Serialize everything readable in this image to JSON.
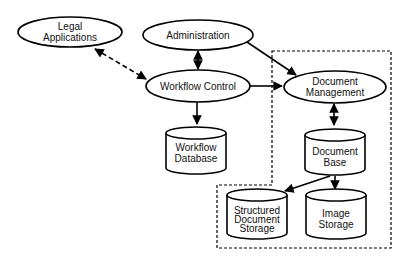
{
  "diagram": {
    "type": "system-architecture",
    "nodes": [
      {
        "id": "legal",
        "shape": "ellipse",
        "lines": [
          "Legal",
          "Applications"
        ]
      },
      {
        "id": "admin",
        "shape": "ellipse",
        "lines": [
          "Administration"
        ]
      },
      {
        "id": "workflow_control",
        "shape": "ellipse",
        "lines": [
          "Workflow Control"
        ]
      },
      {
        "id": "doc_mgmt",
        "shape": "ellipse",
        "lines": [
          "Document",
          "Management"
        ]
      },
      {
        "id": "workflow_db",
        "shape": "cylinder",
        "lines": [
          "Workflow",
          "Database"
        ]
      },
      {
        "id": "doc_base",
        "shape": "cylinder",
        "lines": [
          "Document",
          "Base"
        ]
      },
      {
        "id": "structured_storage",
        "shape": "cylinder",
        "lines": [
          "Structured",
          "Document",
          "Storage"
        ]
      },
      {
        "id": "image_storage",
        "shape": "cylinder",
        "lines": [
          "Image",
          "Storage"
        ]
      }
    ],
    "edges": [
      {
        "from": "legal",
        "to": "workflow_control",
        "style": "dashed",
        "direction": "both"
      },
      {
        "from": "admin",
        "to": "workflow_control",
        "style": "solid",
        "direction": "both"
      },
      {
        "from": "admin",
        "to": "doc_mgmt",
        "style": "solid",
        "direction": "forward"
      },
      {
        "from": "workflow_control",
        "to": "doc_mgmt",
        "style": "solid",
        "direction": "forward"
      },
      {
        "from": "workflow_control",
        "to": "workflow_db",
        "style": "solid",
        "direction": "forward"
      },
      {
        "from": "doc_mgmt",
        "to": "doc_base",
        "style": "solid",
        "direction": "both"
      },
      {
        "from": "doc_base",
        "to": "structured_storage",
        "style": "solid",
        "direction": "forward"
      },
      {
        "from": "doc_base",
        "to": "image_storage",
        "style": "solid",
        "direction": "forward"
      }
    ],
    "boundaries": [
      {
        "id": "document-subsystem-boundary",
        "style": "dashed",
        "contains": [
          "doc_mgmt",
          "doc_base",
          "structured_storage",
          "image_storage"
        ]
      }
    ],
    "colors": {
      "stroke": "#000000",
      "fill": "#ffffff",
      "text": "#111111"
    }
  }
}
